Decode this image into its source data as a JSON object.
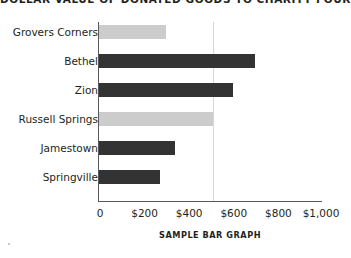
{
  "chart_data": {
    "type": "bar",
    "orientation": "horizontal",
    "title": "DOLLAR VALUE OF DONATED GOODS TO CHARITY FOUR",
    "xlabel": "SAMPLE BAR GRAPH",
    "ylabel": "",
    "categories": [
      "Grovers Corners",
      "Bethel",
      "Zion",
      "Russell Springs",
      "Jamestown",
      "Springville"
    ],
    "values": [
      300,
      700,
      600,
      510,
      340,
      275
    ],
    "bar_colors": [
      "#cccccc",
      "#333333",
      "#333333",
      "#cccccc",
      "#333333",
      "#333333"
    ],
    "xlim": [
      0,
      1000
    ],
    "xticks": [
      0,
      200,
      400,
      600,
      800,
      1000
    ],
    "xtick_labels": [
      "0",
      "$200",
      "$400",
      "$600",
      "$800",
      "$1,000"
    ],
    "grid": true,
    "gridline_values": [
      510
    ],
    "legend": null,
    "axis_color": "#58595b",
    "grid_color": "#d6d6d6",
    "background_color": "#ffffff"
  }
}
